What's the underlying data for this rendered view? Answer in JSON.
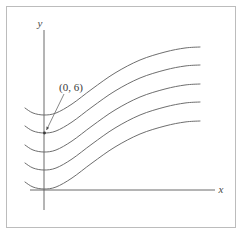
{
  "figure": {
    "title": "",
    "axis_labels": {
      "x": "x",
      "y": "y"
    },
    "annotations": [
      {
        "text": "(0, 6)",
        "points_to": "y-axis-point",
        "target_x": 0,
        "target_y": 6
      }
    ],
    "colors": {
      "curve": "#666666",
      "axis": "#5a5a5a",
      "frame": "#bcbcbc",
      "text": "#3a3a3a",
      "background": "#ffffff"
    }
  },
  "chart_data": {
    "type": "line",
    "title": "",
    "xlabel": "x",
    "ylabel": "y",
    "grid": false,
    "legend": "none",
    "axes": {
      "origin_px": [
        44,
        190
      ],
      "x_axis_from_px": [
        30,
        190
      ],
      "x_axis_to_px": [
        215,
        190
      ],
      "y_axis_from_px": [
        44,
        30
      ],
      "y_axis_to_px": [
        44,
        210
      ]
    },
    "series": [
      {
        "name": "curve-1-top",
        "y_intercept_px": 115,
        "points_px": [
          [
            25,
            108
          ],
          [
            33,
            113
          ],
          [
            44,
            115
          ],
          [
            56,
            113
          ],
          [
            72,
            104
          ],
          [
            92,
            89
          ],
          [
            115,
            73
          ],
          [
            140,
            60
          ],
          [
            165,
            52
          ],
          [
            185,
            48
          ],
          [
            200,
            47
          ]
        ]
      },
      {
        "name": "curve-2",
        "y_intercept_px": 133,
        "points_px": [
          [
            25,
            126
          ],
          [
            33,
            131
          ],
          [
            44,
            133
          ],
          [
            56,
            131
          ],
          [
            72,
            122
          ],
          [
            92,
            107
          ],
          [
            115,
            91
          ],
          [
            140,
            78
          ],
          [
            165,
            70
          ],
          [
            185,
            66
          ],
          [
            200,
            65
          ]
        ]
      },
      {
        "name": "curve-3",
        "y_intercept_px": 152,
        "points_px": [
          [
            25,
            145
          ],
          [
            33,
            150
          ],
          [
            44,
            152
          ],
          [
            56,
            150
          ],
          [
            72,
            141
          ],
          [
            92,
            126
          ],
          [
            115,
            110
          ],
          [
            140,
            97
          ],
          [
            165,
            89
          ],
          [
            185,
            85
          ],
          [
            200,
            84
          ]
        ]
      },
      {
        "name": "curve-4",
        "y_intercept_px": 170,
        "points_px": [
          [
            25,
            163
          ],
          [
            33,
            168
          ],
          [
            44,
            170
          ],
          [
            56,
            168
          ],
          [
            72,
            159
          ],
          [
            92,
            144
          ],
          [
            115,
            128
          ],
          [
            140,
            115
          ],
          [
            165,
            107
          ],
          [
            185,
            103
          ],
          [
            200,
            102
          ]
        ]
      },
      {
        "name": "curve-5-bottom",
        "y_intercept_px": 189,
        "points_px": [
          [
            25,
            182
          ],
          [
            33,
            187
          ],
          [
            44,
            189
          ],
          [
            56,
            187
          ],
          [
            72,
            178
          ],
          [
            92,
            163
          ],
          [
            115,
            147
          ],
          [
            140,
            134
          ],
          [
            165,
            126
          ],
          [
            185,
            122
          ],
          [
            200,
            121
          ]
        ]
      }
    ],
    "annotation_label": "(0, 6)",
    "annotation_label_px": [
      59,
      90
    ],
    "annotation_arrow_from_px": [
      64,
      94
    ],
    "annotation_arrow_to_px": [
      45,
      133
    ]
  }
}
